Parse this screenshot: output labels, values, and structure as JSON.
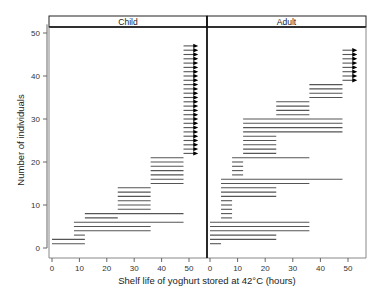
{
  "chart_data": {
    "type": "interval",
    "xlabel": "Shelf life of yoghurt stored at 42°C (hours)",
    "ylabel": "Number of individuals",
    "xlim": [
      0,
      55
    ],
    "ylim": [
      -1,
      52
    ],
    "xticks": [
      0,
      10,
      20,
      30,
      40,
      50
    ],
    "yticks": [
      0,
      10,
      20,
      30,
      40,
      50
    ],
    "grid": false,
    "line_color": "#555555",
    "arrow_color": "#000000",
    "panels": [
      {
        "name": "Child",
        "groups": [
          {
            "start": 0,
            "end": 12,
            "count": 2,
            "censored": false
          },
          {
            "start": 8,
            "end": 12,
            "count": 1,
            "censored": false
          },
          {
            "start": 8,
            "end": 36,
            "count": 2,
            "censored": false
          },
          {
            "start": 8,
            "end": 48,
            "count": 1,
            "censored": false
          },
          {
            "start": 12,
            "end": 24,
            "count": 1,
            "censored": false
          },
          {
            "start": 12,
            "end": 48,
            "count": 1,
            "censored": false
          },
          {
            "start": 24,
            "end": 36,
            "count": 6,
            "censored": false
          },
          {
            "start": 36,
            "end": 48,
            "count": 7,
            "censored": false
          },
          {
            "start": 48,
            "end": 53,
            "count": 26,
            "censored": true
          }
        ]
      },
      {
        "name": "Adult",
        "groups": [
          {
            "start": 0,
            "end": 4,
            "count": 1,
            "censored": false
          },
          {
            "start": 0,
            "end": 24,
            "count": 2,
            "censored": false
          },
          {
            "start": 0,
            "end": 36,
            "count": 3,
            "censored": false
          },
          {
            "start": 4,
            "end": 8,
            "count": 5,
            "censored": false
          },
          {
            "start": 4,
            "end": 24,
            "count": 3,
            "censored": false
          },
          {
            "start": 4,
            "end": 36,
            "count": 1,
            "censored": false
          },
          {
            "start": 4,
            "end": 48,
            "count": 1,
            "censored": false
          },
          {
            "start": 8,
            "end": 12,
            "count": 4,
            "censored": false
          },
          {
            "start": 8,
            "end": 36,
            "count": 1,
            "censored": false
          },
          {
            "start": 12,
            "end": 24,
            "count": 5,
            "censored": false
          },
          {
            "start": 12,
            "end": 48,
            "count": 4,
            "censored": false
          },
          {
            "start": 24,
            "end": 36,
            "count": 4,
            "censored": false
          },
          {
            "start": 36,
            "end": 48,
            "count": 4,
            "censored": false
          },
          {
            "start": 48,
            "end": 53,
            "count": 8,
            "censored": true
          }
        ]
      }
    ]
  }
}
